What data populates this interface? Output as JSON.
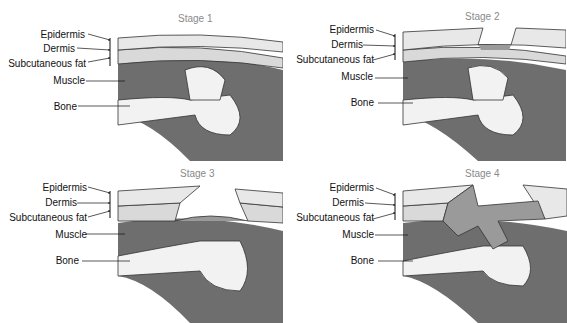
{
  "figure": {
    "panels": [
      {
        "stage": "Stage 1",
        "labels": [
          "Epidermis",
          "Dermis",
          "Subcutaneous fat",
          "Muscle",
          "Bone"
        ]
      },
      {
        "stage": "Stage 2",
        "labels": [
          "Epidermis",
          "Dermis",
          "Subcutaneous fat",
          "Muscle",
          "Bone"
        ]
      },
      {
        "stage": "Stage 3",
        "labels": [
          "Epidermis",
          "Dermis",
          "Subcutaneous fat",
          "Muscle",
          "Bone"
        ]
      },
      {
        "stage": "Stage 4",
        "labels": [
          "Epidermis",
          "Dermis",
          "Subcutaneous fat",
          "Muscle",
          "Bone"
        ]
      }
    ],
    "colors": {
      "skin": "#e8e8e8",
      "fat": "#d9d9d9",
      "muscle": "#6e6e6e",
      "dark": "#555555",
      "bone": "#f2f2f2",
      "wound": "#9a9a9a"
    }
  }
}
